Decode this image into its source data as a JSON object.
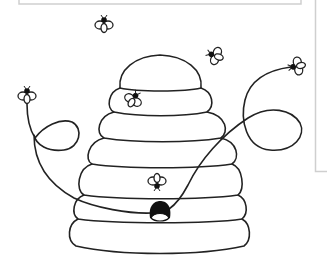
{
  "image": {
    "description": "Line-art coloring page of a beehive with bees flying around and looping flight trails",
    "subject": "beehive",
    "colors": {
      "background": "#ffffff",
      "ink": "#222222",
      "frame": "#cfcfcf",
      "entrance": "#111111"
    }
  },
  "hive": {
    "rings": 7,
    "entrance_icon": "hive-entrance-hole"
  },
  "bees": [
    {
      "id": "bee-top",
      "icon": "bee-icon",
      "x": 104,
      "y": 24
    },
    {
      "id": "bee-upper-right",
      "icon": "bee-icon",
      "x": 215,
      "y": 55
    },
    {
      "id": "bee-far-right",
      "icon": "bee-icon",
      "x": 297,
      "y": 66
    },
    {
      "id": "bee-left",
      "icon": "bee-icon",
      "x": 27,
      "y": 95
    },
    {
      "id": "bee-on-hive-top",
      "icon": "bee-icon",
      "x": 133,
      "y": 99
    },
    {
      "id": "bee-on-hive-middle",
      "icon": "bee-icon",
      "x": 157,
      "y": 182
    }
  ]
}
